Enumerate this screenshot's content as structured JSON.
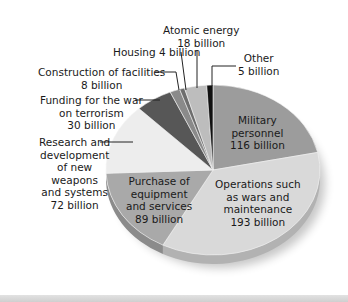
{
  "chart_data": {
    "type": "pie",
    "title": "",
    "unit": "billion",
    "start_angle_deg": 0,
    "direction": "clockwise",
    "slices": [
      {
        "name": "Military personnel",
        "value": 116,
        "color": "#9c9c9c",
        "label_lines": [
          "Military",
          "personnel",
          "116 billion"
        ]
      },
      {
        "name": "Operations such as wars and maintenance",
        "value": 193,
        "color": "#d9d9d9",
        "label_lines": [
          "Operations such",
          "as wars and",
          "maintenance",
          "193 billion"
        ]
      },
      {
        "name": "Purchase of equipment and services",
        "value": 89,
        "color": "#a9a9a9",
        "label_lines": [
          "Purchase of",
          "equipment",
          "and services",
          "89 billion"
        ]
      },
      {
        "name": "Research and development of new weapons and systems",
        "value": 72,
        "color": "#ededed",
        "label_lines": [
          "Research and",
          "development",
          "of new",
          "weapons",
          "and systems",
          "72 billion"
        ]
      },
      {
        "name": "Funding for the war on terrorism",
        "value": 30,
        "color": "#575757",
        "label_lines": [
          "Funding for the war",
          "on terrorism",
          "30 billion"
        ]
      },
      {
        "name": "Construction of facilities",
        "value": 8,
        "color": "#8a8a8a",
        "label_lines": [
          "Construction of facilities",
          "8 billion"
        ]
      },
      {
        "name": "Housing",
        "value": 4,
        "color": "#6e6e6e",
        "label_lines": [
          "Housing 4 billion"
        ]
      },
      {
        "name": "Atomic energy",
        "value": 18,
        "color": "#bdbdbd",
        "label_lines": [
          "Atomic energy",
          "18 billion"
        ]
      },
      {
        "name": "Other",
        "value": 5,
        "color": "#111111",
        "label_lines": [
          "Other",
          "5 billion"
        ]
      }
    ],
    "total": 535
  },
  "labels": {
    "military": [
      "Military",
      "personnel",
      "116 billion"
    ],
    "operations": [
      "Operations such",
      "as wars and",
      "maintenance",
      "193 billion"
    ],
    "purchase": [
      "Purchase of",
      "equipment",
      "and services",
      "89 billion"
    ],
    "research": [
      "Research and",
      "development",
      "of new",
      "weapons",
      "and systems",
      "72 billion"
    ],
    "war": [
      "Funding for the war",
      "on terrorism",
      "30 billion"
    ],
    "construction": [
      "Construction of facilities",
      "8 billion"
    ],
    "housing": [
      "Housing 4 billion"
    ],
    "atomic": [
      "Atomic energy",
      "18 billion"
    ],
    "other": [
      "Other",
      "5 billion"
    ]
  }
}
